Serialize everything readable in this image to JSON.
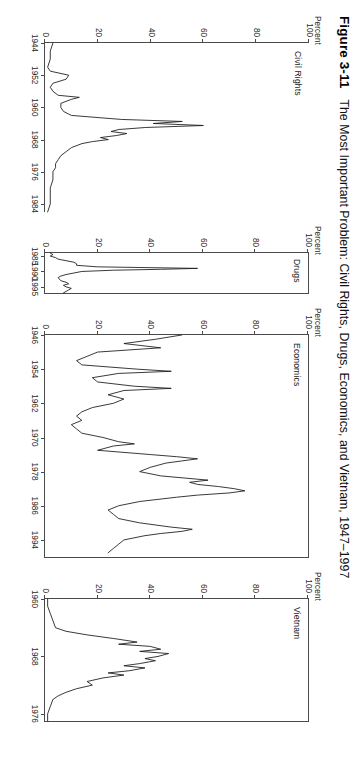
{
  "figure": {
    "number": "Figure 3-11",
    "title": "The Most Important Problem: Civil Rights, Drugs, Economics, and Vietnam, 1947–1997"
  },
  "axis_unit_label": "Percent",
  "chart_data": {
    "type": "line",
    "title": "The Most Important Problem: Civil Rights, Drugs, Economics, and Vietnam, 1947–1997",
    "ylabel": "Percent",
    "xlabel": "",
    "ylim": [
      0,
      100
    ],
    "yticks": [
      0,
      20,
      40,
      60,
      80,
      100
    ],
    "grid": false,
    "legend": "none",
    "panels": [
      {
        "name": "Civil Rights",
        "xlim": [
          1944,
          1986
        ],
        "xticks": [
          1944,
          1952,
          1960,
          1968,
          1976,
          1984
        ],
        "x": [
          1944,
          1946,
          1948,
          1950,
          1951,
          1952,
          1953,
          1954,
          1955,
          1956,
          1957,
          1957.5,
          1958,
          1959,
          1960,
          1961,
          1962,
          1963,
          1963.5,
          1964,
          1964.5,
          1965,
          1965.5,
          1966,
          1966.5,
          1967,
          1967.5,
          1968,
          1968.5,
          1969,
          1970,
          1971,
          1972,
          1973,
          1974,
          1975,
          1976,
          1978,
          1980,
          1982,
          1984,
          1986
        ],
        "y": [
          3,
          2,
          2,
          1,
          2,
          9,
          8,
          3,
          2,
          3,
          5,
          13,
          10,
          6,
          6,
          7,
          10,
          29,
          52,
          41,
          60,
          38,
          28,
          25,
          31,
          27,
          21,
          24,
          18,
          14,
          10,
          8,
          6,
          5,
          4,
          4,
          3,
          3,
          2,
          2,
          2,
          1
        ],
        "peak": {
          "year": 1964,
          "value": 60
        }
      },
      {
        "name": "Drugs",
        "xlim": [
          1984,
          1997
        ],
        "xticks": [
          1985,
          1990,
          1995
        ],
        "x": [
          1984,
          1984.5,
          1985,
          1985.5,
          1986,
          1986.5,
          1987,
          1987.5,
          1988,
          1988.5,
          1989,
          1989.3,
          1989.6,
          1990,
          1990.5,
          1991,
          1991.5,
          1992,
          1993,
          1993.5,
          1994,
          1994.5,
          1995,
          1995.5,
          1996,
          1996.5,
          1997
        ],
        "y": [
          2,
          3,
          2,
          4,
          5,
          8,
          11,
          12,
          12,
          20,
          58,
          44,
          26,
          14,
          11,
          8,
          6,
          5,
          6,
          8,
          9,
          7,
          8,
          10,
          9,
          8,
          7
        ],
        "peak": {
          "year": 1989,
          "value": 58
        }
      },
      {
        "name": "Economics",
        "xlim": [
          1946,
          1998
        ],
        "xticks": [
          1946,
          1954,
          1962,
          1970,
          1978,
          1986,
          1994
        ],
        "x": [
          1946,
          1947,
          1948,
          1949,
          1950,
          1951,
          1952,
          1953,
          1954,
          1954.5,
          1955,
          1956,
          1957,
          1958,
          1958.5,
          1959,
          1960,
          1961,
          1962,
          1963,
          1964,
          1965,
          1966,
          1967,
          1968,
          1969,
          1970,
          1971,
          1971.5,
          1972,
          1973,
          1974,
          1974.5,
          1975,
          1975.5,
          1976,
          1977,
          1978,
          1979,
          1980,
          1980.5,
          1981,
          1981.5,
          1982,
          1982.5,
          1983,
          1983.5,
          1984,
          1985,
          1986,
          1987,
          1988,
          1989,
          1990,
          1991,
          1991.5,
          1992,
          1992.5,
          1993,
          1994,
          1995,
          1996,
          1997
        ],
        "y": [
          52,
          42,
          30,
          44,
          20,
          16,
          12,
          14,
          35,
          48,
          28,
          18,
          20,
          34,
          48,
          30,
          24,
          30,
          26,
          18,
          14,
          12,
          14,
          10,
          12,
          14,
          22,
          28,
          34,
          26,
          20,
          40,
          50,
          58,
          52,
          46,
          40,
          36,
          44,
          62,
          55,
          58,
          66,
          72,
          76,
          70,
          58,
          50,
          36,
          28,
          24,
          26,
          28,
          36,
          48,
          56,
          52,
          44,
          38,
          30,
          28,
          26,
          24
        ],
        "peak": {
          "year": 1983,
          "value": 76
        }
      },
      {
        "name": "Vietnam",
        "xlim": [
          1960,
          1977
        ],
        "xticks": [
          1960,
          1968,
          1976
        ],
        "x": [
          1960,
          1961,
          1962,
          1963,
          1964,
          1964.5,
          1965,
          1965.5,
          1966,
          1966.3,
          1966.6,
          1967,
          1967.3,
          1967.6,
          1968,
          1968.3,
          1968.6,
          1969,
          1969.3,
          1969.6,
          1970,
          1970.3,
          1970.6,
          1971,
          1971.5,
          1972,
          1972.5,
          1973,
          1973.5,
          1974,
          1975,
          1976,
          1977
        ],
        "y": [
          1,
          1,
          2,
          3,
          4,
          8,
          16,
          26,
          35,
          28,
          40,
          44,
          36,
          47,
          43,
          38,
          42,
          36,
          30,
          38,
          32,
          24,
          30,
          22,
          16,
          18,
          12,
          8,
          5,
          3,
          2,
          1,
          1
        ],
        "peak": {
          "year": 1967,
          "value": 47
        }
      }
    ]
  }
}
